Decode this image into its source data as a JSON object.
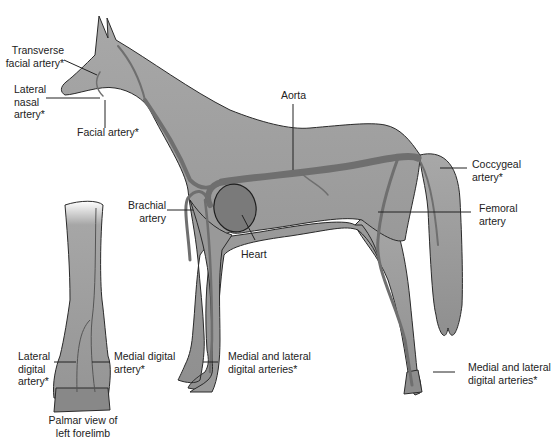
{
  "diagram": {
    "colors": {
      "body_fill": "#9d9d9d",
      "body_stroke": "#2a2a2a",
      "artery": "#6f6f6f",
      "heart_fill": "#7a7a7a",
      "leader_line": "#222222"
    },
    "labels": {
      "transverse_facial": "Transverse\nfacial artery*",
      "lateral_nasal": "Lateral\nnasal\nartery*",
      "facial": "Facial artery*",
      "aorta": "Aorta",
      "coccygeal": "Coccygeal\nartery*",
      "femoral": "Femoral\nartery",
      "brachial": "Brachial\nartery",
      "heart": "Heart",
      "fore_digital": "Medial and lateral\ndigital arteries*",
      "hind_digital": "Medial and lateral\ndigital arteries*",
      "lateral_digital": "Lateral\ndigital\nartery*",
      "medial_digital": "Medial digital\nartery*",
      "palmar_caption": "Palmar view of\nleft forelimb"
    }
  }
}
